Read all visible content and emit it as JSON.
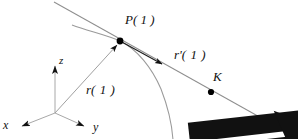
{
  "figure": {
    "background_color": "#ffffff",
    "curve_color": "#9a9a9a",
    "line_color": "#8f8f8f",
    "axis_color": "#a8a8a8",
    "marker_color": "#000000",
    "text_color": "#111111",
    "width": 298,
    "height": 139
  },
  "labels": {
    "point_p": "P( 1 )",
    "tangent_vector": "r",
    "tangent_vector_prime": "'",
    "tangent_vector_arg": "( 1 )",
    "position_vector": "r",
    "position_vector_arg": "( 1 )",
    "point_k": "K",
    "line_b": "b",
    "axis_x": "x",
    "axis_y": "y",
    "axis_z": "z"
  },
  "geometry": {
    "origin": {
      "x": 55,
      "y": 113
    },
    "point_p": {
      "x": 120,
      "y": 41
    },
    "point_k": {
      "x": 211,
      "y": 92
    },
    "tangent_line_start": {
      "x": 54,
      "y": 2
    },
    "tangent_line_end": {
      "x": 279,
      "y": 128
    },
    "tangent_arrowhead": {
      "x": 163,
      "y": 64
    },
    "z_axis_tip": {
      "x": 55,
      "y": 62
    },
    "x_axis_tip": {
      "x": 17,
      "y": 128
    },
    "y_axis_tip": {
      "x": 88,
      "y": 128
    },
    "curve_start": {
      "x": 72,
      "y": 25
    },
    "curve_end": {
      "x": 173,
      "y": 139
    }
  }
}
